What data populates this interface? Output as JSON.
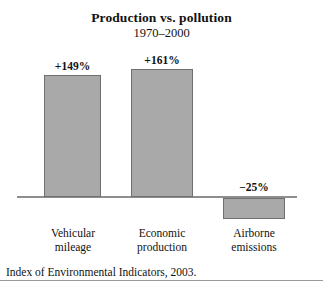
{
  "chart_data": {
    "type": "bar",
    "title": "Production vs. pollution",
    "subtitle": "1970–2000",
    "xlabel": "",
    "ylabel": "",
    "grid": false,
    "legend": "none",
    "orientation": "vertical",
    "baseline": 0,
    "ylim": [
      -40,
      180
    ],
    "categories": [
      "Vehicular mileage",
      "Economic production",
      "Airborne emissions"
    ],
    "category_lines": [
      [
        "Vehicular",
        "mileage"
      ],
      [
        "Economic",
        "production"
      ],
      [
        "Airborne",
        "emissions"
      ]
    ],
    "values": [
      149,
      161,
      -25
    ],
    "data_labels": [
      "+149%",
      "+161%",
      "−25%"
    ],
    "bar_fill": "#a9a9a9",
    "bar_stroke": "#6f6f6f",
    "axis_color": "#8e8e8e"
  },
  "source_note": "Index of Environmental Indicators, 2003."
}
